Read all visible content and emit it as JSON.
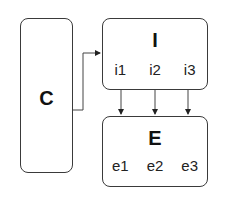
{
  "diagram": {
    "nodes": [
      {
        "id": "C",
        "label": "C",
        "items": []
      },
      {
        "id": "I",
        "label": "I",
        "items": [
          "i1",
          "i2",
          "i3"
        ]
      },
      {
        "id": "E",
        "label": "E",
        "items": [
          "e1",
          "e2",
          "e3"
        ]
      }
    ],
    "edges": [
      {
        "from": "C",
        "to": "I"
      },
      {
        "from": "i1",
        "to": "e1"
      },
      {
        "from": "i2",
        "to": "e2"
      },
      {
        "from": "i3",
        "to": "e3"
      }
    ],
    "colors": {
      "stroke": "#3a3a3a",
      "text": "#111111",
      "background": "#ffffff"
    }
  }
}
